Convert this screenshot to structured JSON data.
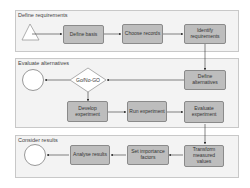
{
  "lanes": [
    {
      "title": "Define requirements"
    },
    {
      "title": "Evaluate alternatives"
    },
    {
      "title": "Consider results"
    }
  ],
  "nodes": {
    "define_basis": "Define basis",
    "choose_records": "Choose records",
    "identify_requirements": "Identify requirements",
    "define_alternatives": "Define alternatives",
    "go_no_go": "Go/No-GO",
    "develop_experiment": "Develop experiment",
    "run_experiment": "Run experiment",
    "evaluate_experiment": "Evaluate experiment",
    "transform_values": "Transform measured values",
    "set_importance": "Set importance factors",
    "analyse_results": "Analyse results"
  },
  "colors": {
    "box_fill": "#bdbdbd",
    "lane_fill": "#f3f3f3",
    "arrow": "#333333"
  }
}
